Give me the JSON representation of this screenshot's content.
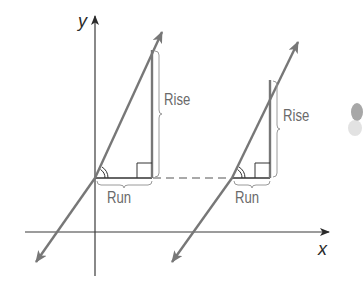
{
  "axes": {
    "x_label": "x",
    "y_label": "y"
  },
  "left_triangle": {
    "rise_label": "Rise",
    "run_label": "Run"
  },
  "right_triangle": {
    "rise_label": "Rise",
    "run_label": "Run"
  },
  "colors": {
    "axis": "#3a3a3a",
    "line": "#7a7a7a",
    "brace": "#9a9a9a",
    "text": "#6a6a6a"
  }
}
